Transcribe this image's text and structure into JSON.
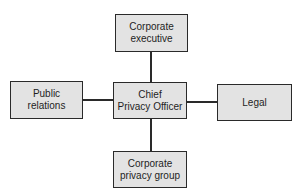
{
  "diagram": {
    "type": "org-chart",
    "colors": {
      "box_fill": "#e3e3e3",
      "box_border": "#2a2a2a",
      "line": "#2a2a2a",
      "text": "#1e1e1e"
    },
    "nodes": {
      "top": {
        "label_line1": "Corporate",
        "label_line2": "executive"
      },
      "left": {
        "label_line1": "Public",
        "label_line2": "relations"
      },
      "center": {
        "label_line1": "Chief",
        "label_line2": "Privacy Officer"
      },
      "right": {
        "label": "Legal"
      },
      "bottom": {
        "label_line1": "Corporate",
        "label_line2": "privacy group"
      }
    },
    "edges": [
      {
        "from": "center",
        "to": "top"
      },
      {
        "from": "center",
        "to": "left"
      },
      {
        "from": "center",
        "to": "right"
      },
      {
        "from": "center",
        "to": "bottom"
      }
    ]
  }
}
